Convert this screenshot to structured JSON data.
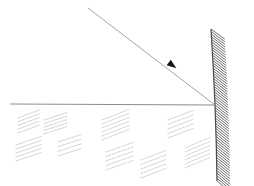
{
  "diagram": {
    "title": "Concave mirror ray diagram",
    "type": "optics-ray-diagram",
    "canvas": {
      "width": 254,
      "height": 186,
      "background": "#ffffff"
    },
    "colors": {
      "axis": "#8d8d8d",
      "ray": "#9a9a9a",
      "mirror": "#4a4a4a",
      "hatch": "#555555",
      "arrowhead": "#151515",
      "scribble": "#a9a9b4"
    },
    "principal_axis": {
      "label": "principal-axis",
      "x1": 10,
      "y1": 104,
      "x2": 215,
      "y2": 105
    },
    "incident_ray": {
      "label": "incident-ray",
      "x1": 88,
      "y1": 8,
      "x2": 215,
      "y2": 105,
      "arrow": {
        "x": 172,
        "y": 65,
        "angle_deg": 37,
        "size": 5.5
      }
    },
    "mirror": {
      "label": "concave-mirror",
      "top": {
        "x": 211,
        "y": 29
      },
      "vertex": {
        "x": 215,
        "y": 105
      },
      "bottom": {
        "x": 217,
        "y": 181
      },
      "bulge_x": 203,
      "hatch_count": 58,
      "hatch_thickness": 13
    },
    "scribbles": [
      {
        "x": 18,
        "y": 118,
        "w": 22,
        "h": 15,
        "lines": 5
      },
      {
        "x": 44,
        "y": 120,
        "w": 24,
        "h": 14,
        "lines": 5
      },
      {
        "x": 16,
        "y": 145,
        "w": 26,
        "h": 16,
        "lines": 5
      },
      {
        "x": 58,
        "y": 142,
        "w": 24,
        "h": 14,
        "lines": 4
      },
      {
        "x": 102,
        "y": 120,
        "w": 28,
        "h": 20,
        "lines": 6
      },
      {
        "x": 106,
        "y": 152,
        "w": 28,
        "h": 18,
        "lines": 5
      },
      {
        "x": 141,
        "y": 160,
        "w": 26,
        "h": 18,
        "lines": 5
      },
      {
        "x": 168,
        "y": 120,
        "w": 26,
        "h": 18,
        "lines": 5
      },
      {
        "x": 185,
        "y": 148,
        "w": 26,
        "h": 20,
        "lines": 6
      }
    ]
  }
}
